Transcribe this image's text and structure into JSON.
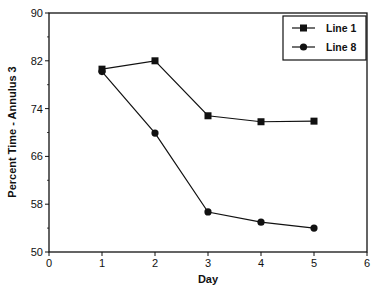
{
  "chart_data": {
    "type": "line",
    "title": "",
    "xlabel": "Day",
    "ylabel": "Percent Time - Annulus 3",
    "x": [
      1,
      2,
      3,
      4,
      5
    ],
    "series": [
      {
        "name": "Line 1",
        "marker": "square",
        "values": [
          80.6,
          82.0,
          72.8,
          71.8,
          71.9
        ]
      },
      {
        "name": "Line 8",
        "marker": "circle",
        "values": [
          80.2,
          69.9,
          56.7,
          55.0,
          54.0
        ]
      }
    ],
    "xlim": [
      0,
      6
    ],
    "ylim": [
      50,
      90
    ],
    "xticks": [
      "0",
      "1",
      "2",
      "3",
      "4",
      "5",
      "6"
    ],
    "yticks": [
      "50",
      "58",
      "66",
      "74",
      "82",
      "90"
    ],
    "grid": false,
    "legend_position": "top-right"
  }
}
